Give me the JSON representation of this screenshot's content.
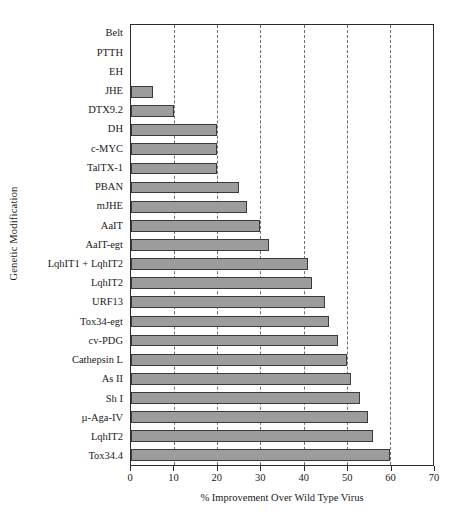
{
  "chart_data": {
    "type": "bar",
    "orientation": "horizontal",
    "title": "",
    "xlabel": "% Improvement Over Wild Type Virus",
    "ylabel": "Genetic Modification",
    "xlim": [
      0,
      70
    ],
    "xticks": [
      0,
      10,
      20,
      30,
      40,
      50,
      60,
      70
    ],
    "xtick_labels": [
      "0",
      "10",
      "20",
      "30",
      "40",
      "50",
      "60",
      "70"
    ],
    "grid": "vertical-dashed",
    "legend": "none",
    "bar_color": "#9c9c9c",
    "bar_edge_color": "#3a3a3a",
    "axis_color": "#2b2b2b",
    "categories": [
      "Belt",
      "PTTH",
      "EH",
      "JHE",
      "DTX9.2",
      "DH",
      "c-MYC",
      "TalTX-1",
      "PBAN",
      "mJHE",
      "AaIT",
      "AaIT-egt",
      "LqhIT1 + LqhIT2",
      "LqhIT2",
      "URF13",
      "Tox34-egt",
      "cv-PDG",
      "Cathepsin L",
      "As II",
      "Sh I",
      "µ-Aga-IV",
      "LqhIT2",
      "Tox34.4"
    ],
    "values": [
      0,
      0,
      0,
      5,
      10,
      20,
      20,
      20,
      25,
      27,
      30,
      32,
      41,
      42,
      45,
      46,
      48,
      50,
      51,
      53,
      55,
      56,
      60
    ]
  }
}
